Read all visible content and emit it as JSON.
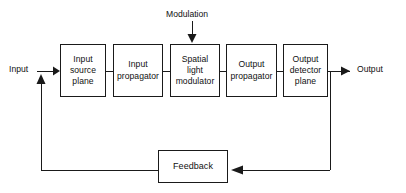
{
  "diagram": {
    "type": "block-diagram",
    "line_color": "#1a1a1a",
    "background_color": "#ffffff",
    "blocks": [
      {
        "id": "input-source-plane",
        "label": "Input\nsource\nplane"
      },
      {
        "id": "input-propagator",
        "label": "Input\npropagator"
      },
      {
        "id": "spatial-light-modulator",
        "label": "Spatial\nlight\nmodulator"
      },
      {
        "id": "output-propagator",
        "label": "Output\npropagator"
      },
      {
        "id": "output-detector-plane",
        "label": "Output\ndetector\nplane"
      },
      {
        "id": "feedback",
        "label": "Feedback"
      }
    ],
    "labels": {
      "input": "Input",
      "output": "Output",
      "modulation": "Modulation"
    },
    "connections": [
      {
        "from": "input",
        "to": "input-source-plane",
        "arrow": "right"
      },
      {
        "from": "input-source-plane",
        "to": "input-propagator",
        "arrow": "none"
      },
      {
        "from": "input-propagator",
        "to": "spatial-light-modulator",
        "arrow": "none"
      },
      {
        "from": "modulation",
        "to": "spatial-light-modulator",
        "arrow": "down"
      },
      {
        "from": "spatial-light-modulator",
        "to": "output-propagator",
        "arrow": "none"
      },
      {
        "from": "output-propagator",
        "to": "output-detector-plane",
        "arrow": "none"
      },
      {
        "from": "output-detector-plane",
        "to": "output",
        "arrow": "right"
      },
      {
        "from": "output-detector-plane",
        "to": "feedback",
        "arrow": "left"
      },
      {
        "from": "feedback",
        "to": "input-source-plane",
        "arrow": "up"
      }
    ]
  }
}
